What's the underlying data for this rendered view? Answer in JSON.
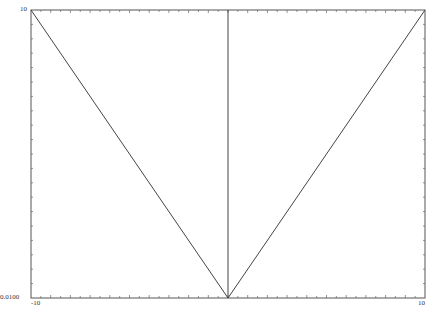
{
  "chart_data": {
    "type": "line",
    "title": "",
    "xlabel": "",
    "ylabel": "",
    "xlim": [
      -10,
      10
    ],
    "ylim": [
      0.01,
      10
    ],
    "yscale": "log",
    "grid": false,
    "legend": null,
    "x_tick_labels": [
      "-10",
      "10"
    ],
    "y_tick_labels": [
      "0.0100",
      "10"
    ],
    "series": [
      {
        "name": "|x| (log y)",
        "x": [
          -10,
          0,
          10
        ],
        "y": [
          10,
          0.01,
          10
        ]
      }
    ],
    "vertical_lines": [
      {
        "x": 0,
        "y_from": 0.01,
        "y_to": 10
      }
    ]
  },
  "labels": {
    "y_top": "10",
    "y_bottom": "0.0100",
    "x_left": "-10",
    "x_right": "10"
  },
  "colors": {
    "axis": "#555555",
    "line": "#444444",
    "background": "#ffffff"
  }
}
